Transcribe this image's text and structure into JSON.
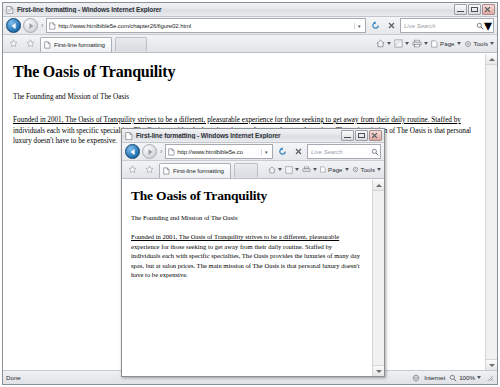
{
  "outer_window": {
    "title": "First-line formatting - Windows Internet Explorer",
    "title_icon": "page-icon",
    "window_buttons": {
      "minimize": "Minimize",
      "maximize": "Maximize",
      "close": "Close"
    },
    "navigation": {
      "back_label": "Back",
      "forward_label": "Forward",
      "separator": "›"
    },
    "address": {
      "url": "http://www.htmlbible5e.com/chapter26/figure02.html",
      "dropdown_glyph": "▾"
    },
    "refresh_label": "Refresh",
    "stop_label": "Stop",
    "search": {
      "placeholder": "Live Search",
      "search_glyph": "⚲",
      "dropdown_glyph": "▾"
    },
    "favorites": {
      "add_label": "Add to Favorites",
      "center_label": "Favorites Center"
    },
    "tab": {
      "label": "First-line formatting",
      "icon": "page-icon"
    },
    "command_bar": {
      "home_label": "Home",
      "feeds_label": "Feeds",
      "print_label": "Print",
      "page_label": "Page",
      "tools_label": "Tools",
      "caret_glyph": "▾"
    },
    "status": {
      "text": "Done",
      "zone": "Internet",
      "zoom": "100%",
      "zoom_caret": "▾"
    }
  },
  "inner_window": {
    "title": "First-line formatting - Windows Internet Explorer",
    "window_buttons": {
      "minimize": "Minimize",
      "maximize": "Maximize",
      "close": "Close"
    },
    "navigation": {
      "back_label": "Back",
      "forward_label": "Forward",
      "separator": "›"
    },
    "address": {
      "url": "http://www.htmlbible5e.co",
      "dropdown_glyph": "▾"
    },
    "search": {
      "placeholder": "Live Search",
      "search_glyph": "⚲"
    },
    "tab": {
      "label": "First-line formatting"
    },
    "command_bar": {
      "page_label": "Page",
      "tools_label": "Tools",
      "caret_glyph": "▾"
    }
  },
  "document": {
    "heading": "The Oasis of Tranquility",
    "subheading": "The Founding and Mission of The Oasis",
    "paragraph_first_line": "Founded in 2001, The Oasis of Tranquility strives to be a different, pleasurable experience for those seeking to get away from their daily routine. Staffed by",
    "paragraph_rest": " individuals each with specific specialties, The Oasis provides the luxuries of many day spas, but at salon prices. The main mission of The Oasis is that personal luxury doesn't have to be expensive.",
    "inner_paragraph_first_line": "Founded in 2001, The Oasis of Tranquility strives to be a different, pleasurable",
    "inner_paragraph_rest": " experience for those seeking to get away from their daily routine. Staffed by individuals each with specific specialties, The Oasis provides the luxuries of many day spas, but at salon prices. The main mission of The Oasis is that personal luxury doesn't have to be expensive."
  },
  "colors": {
    "chrome": "#e4e6e9",
    "page_bg": "#ffffff",
    "text": "#000000",
    "back_button": "#1f6fae"
  }
}
